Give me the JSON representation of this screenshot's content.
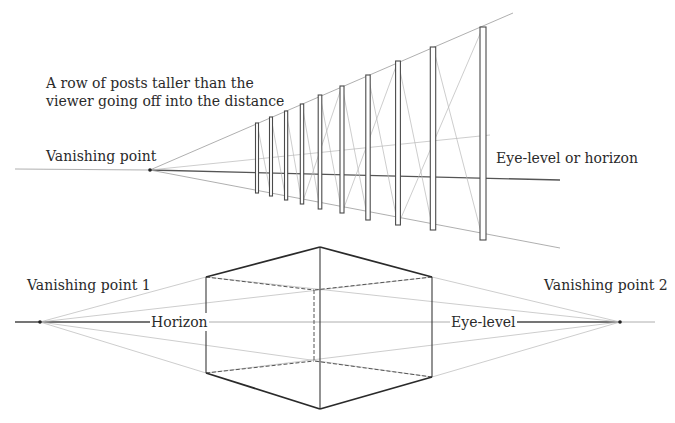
{
  "figure": {
    "top_diagram": {
      "title": "One-point perspective: row of posts",
      "caption_line1": "A row of posts taller than the",
      "caption_line2": "viewer going off into the distance",
      "vanishing_point_label": "Vanishing point",
      "horizon_label": "Eye-level or horizon",
      "vanishing_point": [
        150,
        170
      ],
      "post_count": 10,
      "posts": [
        {
          "x": 257,
          "top": 123,
          "bottom": 193
        },
        {
          "x": 271,
          "top": 117,
          "bottom": 196
        },
        {
          "x": 286,
          "top": 111,
          "bottom": 200
        },
        {
          "x": 302,
          "top": 104,
          "bottom": 204
        },
        {
          "x": 320,
          "top": 95,
          "bottom": 209
        },
        {
          "x": 342,
          "top": 86,
          "bottom": 213
        },
        {
          "x": 368,
          "top": 75,
          "bottom": 220
        },
        {
          "x": 398,
          "top": 61,
          "bottom": 225
        },
        {
          "x": 433,
          "top": 47,
          "bottom": 230
        },
        {
          "x": 483,
          "top": 27,
          "bottom": 240
        }
      ]
    },
    "bottom_diagram": {
      "title": "Two-point perspective: box",
      "vp1_label": "Vanishing point 1",
      "vp2_label": "Vanishing point 2",
      "horizon_label": "Horizon",
      "eye_level_label": "Eye-level",
      "vanishing_point_1": [
        40,
        322
      ],
      "vanishing_point_2": [
        620,
        322
      ],
      "horizon_y": 322
    }
  }
}
